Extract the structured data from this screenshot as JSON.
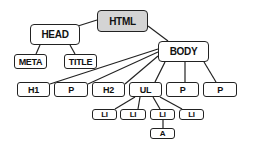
{
  "diagram": {
    "type": "tree",
    "colors": {
      "root_fill": "#d4d4d4",
      "node_fill": "#ffffff",
      "stroke": "#222222"
    },
    "nodes": {
      "html": {
        "label": "HTML"
      },
      "head": {
        "label": "HEAD"
      },
      "body": {
        "label": "BODY"
      },
      "meta": {
        "label": "META"
      },
      "title": {
        "label": "TITLE"
      },
      "h1": {
        "label": "H1"
      },
      "p1": {
        "label": "P"
      },
      "h2": {
        "label": "H2"
      },
      "ul": {
        "label": "UL"
      },
      "p2": {
        "label": "P"
      },
      "p3": {
        "label": "P"
      },
      "li1": {
        "label": "LI"
      },
      "li2": {
        "label": "LI"
      },
      "li3": {
        "label": "LI"
      },
      "li4": {
        "label": "LI"
      },
      "a": {
        "label": "A"
      }
    },
    "edges": [
      [
        "html",
        "head"
      ],
      [
        "html",
        "body"
      ],
      [
        "head",
        "meta"
      ],
      [
        "head",
        "title"
      ],
      [
        "body",
        "h1"
      ],
      [
        "body",
        "p1"
      ],
      [
        "body",
        "h2"
      ],
      [
        "body",
        "ul"
      ],
      [
        "body",
        "p2"
      ],
      [
        "body",
        "p3"
      ],
      [
        "ul",
        "li1"
      ],
      [
        "ul",
        "li2"
      ],
      [
        "ul",
        "li3"
      ],
      [
        "ul",
        "li4"
      ],
      [
        "li3",
        "a"
      ]
    ]
  }
}
